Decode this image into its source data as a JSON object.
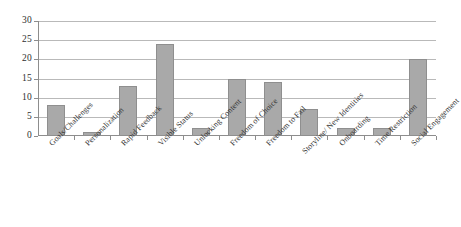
{
  "chart_data": {
    "type": "bar",
    "title": "",
    "subtitle": "",
    "xlabel": "",
    "ylabel": "",
    "ylim": [
      0,
      30
    ],
    "ytick_step": 5,
    "yticks": [
      0,
      5,
      10,
      15,
      20,
      25,
      30
    ],
    "grid": "horizontal",
    "legend": "none",
    "bar_color": "#a9a9a9",
    "categories": [
      "Goals/Challenges",
      "Personalization",
      "Rapid Feedback",
      "Visible Status",
      "Unlocking Content",
      "Freedom of Choice",
      "Freedom to Fail",
      "Storyline/ New Identities",
      "Onboarding",
      "Time Restriction",
      "Social Engagement"
    ],
    "values": [
      8,
      1,
      13,
      24,
      2,
      15,
      14,
      7,
      2,
      2,
      20
    ],
    "series": [
      {
        "name": "",
        "values": [
          8,
          1,
          13,
          24,
          2,
          15,
          14,
          7,
          2,
          2,
          20
        ]
      }
    ]
  }
}
